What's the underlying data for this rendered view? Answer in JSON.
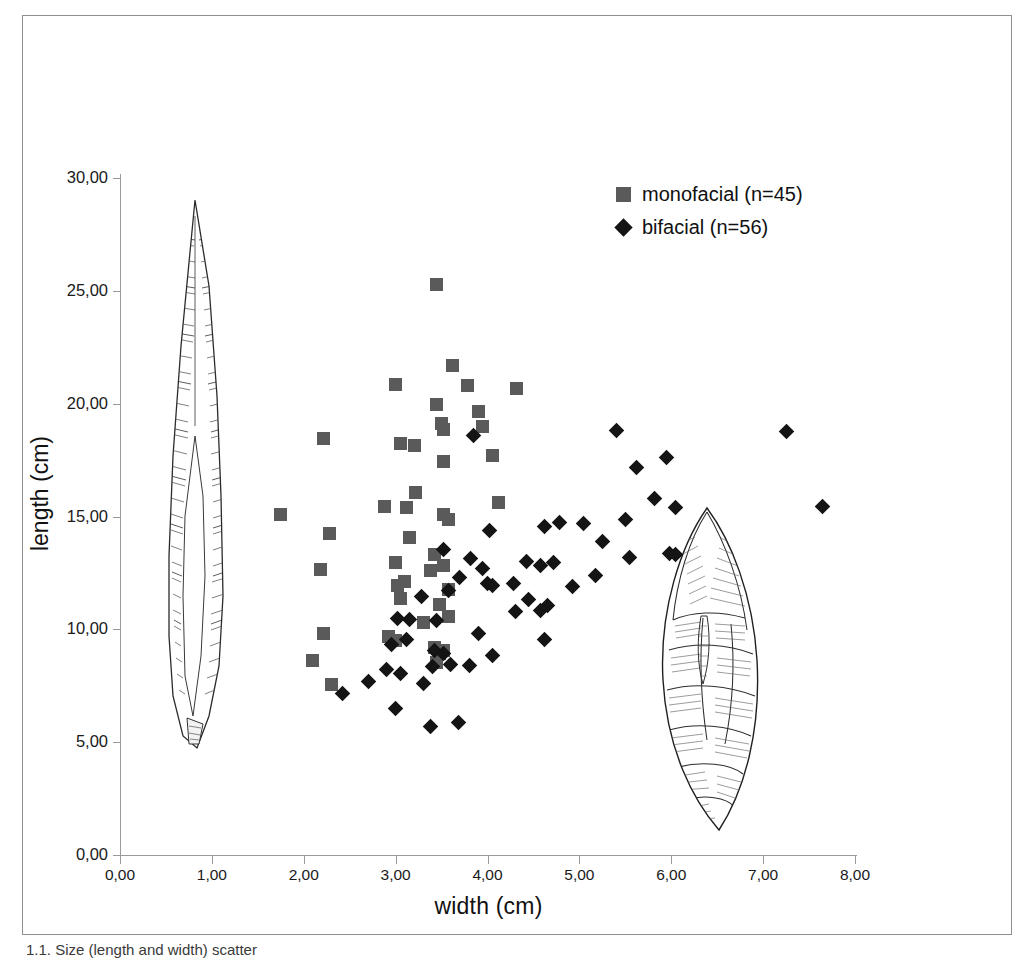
{
  "figure": {
    "caption_fragment": "1.1. Size (length and width) scatter"
  },
  "axes": {
    "x_title": "width (cm)",
    "y_title": "length (cm)",
    "x_ticks": [
      "0,00",
      "1,00",
      "2,00",
      "3,00",
      "4,00",
      "5,00",
      "6,00",
      "7,00",
      "8,00"
    ],
    "y_ticks": [
      "0,00",
      "5,00",
      "10,00",
      "15,00",
      "20,00",
      "25,00",
      "30,00"
    ]
  },
  "legend": {
    "items": [
      {
        "label": "monofacial (n=45)",
        "marker": "square",
        "color": "#5a5a5a"
      },
      {
        "label": "bifacial (n=56)",
        "marker": "diamond",
        "color": "#141414"
      }
    ]
  },
  "artifacts": [
    {
      "name": "monofacial-point-drawing",
      "description": "elongated narrow lithic point"
    },
    {
      "name": "bifacial-point-drawing",
      "description": "broad teardrop lithic biface"
    }
  ],
  "chart_data": {
    "type": "scatter",
    "title": "",
    "xlabel": "width (cm)",
    "ylabel": "length (cm)",
    "xlim": [
      0,
      8
    ],
    "ylim": [
      0,
      30
    ],
    "xticks": [
      0,
      1,
      2,
      3,
      4,
      5,
      6,
      7,
      8
    ],
    "yticks": [
      0,
      5,
      10,
      15,
      20,
      25,
      30
    ],
    "grid": false,
    "legend_position": "top-right",
    "decimal_separator": ",",
    "series": [
      {
        "name": "monofacial (n=45)",
        "marker": "square",
        "color": "#5a5a5a",
        "n": 45,
        "points": [
          [
            3.45,
            25.3
          ],
          [
            3.62,
            21.7
          ],
          [
            3.0,
            20.85
          ],
          [
            3.78,
            20.8
          ],
          [
            4.32,
            20.65
          ],
          [
            3.45,
            19.95
          ],
          [
            3.9,
            19.65
          ],
          [
            3.5,
            19.1
          ],
          [
            3.52,
            18.85
          ],
          [
            2.22,
            18.45
          ],
          [
            3.05,
            18.25
          ],
          [
            3.2,
            18.15
          ],
          [
            3.52,
            17.45
          ],
          [
            4.05,
            17.7
          ],
          [
            2.88,
            15.45
          ],
          [
            3.12,
            15.4
          ],
          [
            1.75,
            15.1
          ],
          [
            3.52,
            15.1
          ],
          [
            4.12,
            15.6
          ],
          [
            3.58,
            14.85
          ],
          [
            2.28,
            14.25
          ],
          [
            3.15,
            14.05
          ],
          [
            3.42,
            13.3
          ],
          [
            3.0,
            12.95
          ],
          [
            3.52,
            12.85
          ],
          [
            2.18,
            12.65
          ],
          [
            3.02,
            11.95
          ],
          [
            3.05,
            11.35
          ],
          [
            3.58,
            11.75
          ],
          [
            3.48,
            11.1
          ],
          [
            3.58,
            10.55
          ],
          [
            2.22,
            9.8
          ],
          [
            2.92,
            9.7
          ],
          [
            3.0,
            9.5
          ],
          [
            3.42,
            9.2
          ],
          [
            3.48,
            8.95
          ],
          [
            3.45,
            8.55
          ],
          [
            2.1,
            8.6
          ],
          [
            2.3,
            7.55
          ],
          [
            3.52,
            9.05
          ],
          [
            3.1,
            12.1
          ],
          [
            3.38,
            12.6
          ],
          [
            3.22,
            16.05
          ],
          [
            3.95,
            19.0
          ],
          [
            3.3,
            10.3
          ]
        ]
      },
      {
        "name": "bifacial (n=56)",
        "marker": "diamond",
        "color": "#141414",
        "n": 56,
        "points": [
          [
            5.4,
            18.8
          ],
          [
            7.25,
            18.75
          ],
          [
            3.85,
            18.6
          ],
          [
            5.62,
            17.15
          ],
          [
            5.95,
            17.6
          ],
          [
            5.82,
            15.8
          ],
          [
            7.65,
            15.45
          ],
          [
            6.05,
            15.4
          ],
          [
            5.5,
            14.85
          ],
          [
            4.78,
            14.75
          ],
          [
            5.05,
            14.7
          ],
          [
            4.62,
            14.55
          ],
          [
            4.02,
            14.4
          ],
          [
            5.25,
            13.9
          ],
          [
            3.52,
            13.55
          ],
          [
            5.55,
            13.2
          ],
          [
            5.98,
            13.35
          ],
          [
            6.05,
            13.3
          ],
          [
            4.72,
            12.95
          ],
          [
            4.58,
            12.85
          ],
          [
            3.82,
            13.15
          ],
          [
            3.7,
            12.3
          ],
          [
            4.0,
            12.05
          ],
          [
            4.05,
            11.95
          ],
          [
            4.92,
            11.9
          ],
          [
            3.58,
            11.7
          ],
          [
            3.28,
            11.45
          ],
          [
            4.3,
            10.8
          ],
          [
            4.65,
            11.05
          ],
          [
            4.58,
            10.85
          ],
          [
            3.45,
            10.4
          ],
          [
            3.15,
            10.45
          ],
          [
            4.62,
            9.55
          ],
          [
            3.02,
            10.5
          ],
          [
            3.12,
            9.55
          ],
          [
            2.95,
            9.35
          ],
          [
            3.42,
            9.05
          ],
          [
            3.52,
            8.95
          ],
          [
            4.05,
            8.85
          ],
          [
            3.6,
            8.45
          ],
          [
            3.8,
            8.4
          ],
          [
            3.4,
            8.35
          ],
          [
            3.05,
            8.05
          ],
          [
            2.9,
            8.2
          ],
          [
            2.7,
            7.7
          ],
          [
            3.3,
            7.6
          ],
          [
            2.42,
            7.15
          ],
          [
            3.0,
            6.5
          ],
          [
            3.38,
            5.7
          ],
          [
            3.68,
            5.85
          ],
          [
            3.95,
            12.7
          ],
          [
            4.28,
            12.05
          ],
          [
            5.18,
            12.4
          ],
          [
            4.45,
            11.3
          ],
          [
            3.9,
            9.8
          ],
          [
            4.42,
            13.0
          ]
        ]
      }
    ]
  }
}
